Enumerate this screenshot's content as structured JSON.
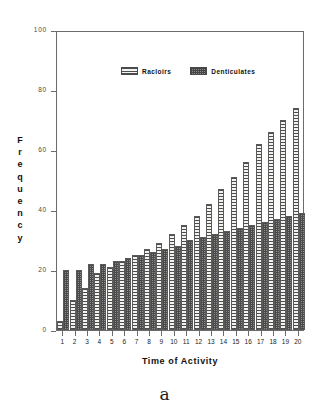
{
  "chart_data": {
    "type": "bar",
    "title": "",
    "xlabel": "Time of Activity",
    "ylabel": "Frequency",
    "ylim": [
      0,
      100
    ],
    "yticks": [
      0,
      20,
      40,
      60,
      80,
      100
    ],
    "grid": false,
    "legend_position": "top-left-inside",
    "categories": [
      "1",
      "2",
      "3",
      "4",
      "5",
      "6",
      "7",
      "8",
      "9",
      "10",
      "11",
      "12",
      "13",
      "14",
      "15",
      "16",
      "17",
      "18",
      "19",
      "20"
    ],
    "series": [
      {
        "name": "Racloirs",
        "values": [
          3,
          10,
          14,
          19,
          21,
          23,
          25,
          27,
          29,
          32,
          35,
          38,
          42,
          47,
          51,
          56,
          62,
          66,
          70,
          74
        ]
      },
      {
        "name": "Denticulates",
        "values": [
          20,
          20,
          22,
          22,
          23,
          24,
          25,
          26,
          27,
          28,
          30,
          31,
          32,
          33,
          34,
          35,
          36,
          37,
          38,
          39
        ]
      }
    ]
  },
  "legend": {
    "entries": [
      {
        "label": "Racloirs",
        "swatch": "light-horizontal-stripes"
      },
      {
        "label": "Denticulates",
        "swatch": "dark-crosshatch"
      }
    ]
  },
  "axes": {
    "y_title": "Frequency",
    "x_title": "Time of Activity"
  },
  "caption": {
    "text": "a"
  },
  "colors": {
    "axis": "#6b6b6b",
    "ytick_label": "#3d4f3d",
    "text": "#111111",
    "racloirs_fill": "#ececea",
    "denticulates_fill": "#8a8a8a",
    "background": "#ffffff"
  }
}
